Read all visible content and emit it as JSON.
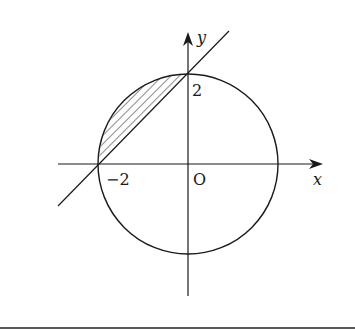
{
  "figure": {
    "type": "coordinate-diagram",
    "axes": {
      "x_label": "x",
      "y_label": "y",
      "origin_label": "O"
    },
    "tick_labels": {
      "x_neg2": "−2",
      "y_pos2": "2"
    },
    "circle": {
      "center": [
        0,
        0
      ],
      "radius": 2
    },
    "line": {
      "equation": "y = x + 2",
      "points": [
        [
          -2,
          0
        ],
        [
          0,
          2
        ]
      ]
    },
    "shaded_region": {
      "bounded_by": [
        "circle arc",
        "line y = x + 2"
      ],
      "quadrant": 2,
      "pattern": "hatched"
    },
    "colors": {
      "stroke": "#1a1a1a",
      "background": "#ffffff",
      "rule": "#5a5a5a"
    }
  }
}
